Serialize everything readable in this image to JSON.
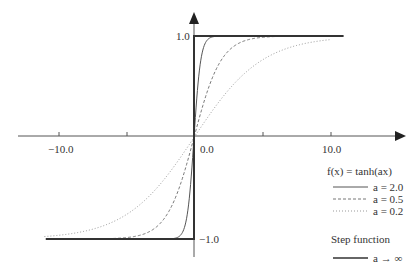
{
  "chart_data": {
    "type": "line",
    "title": "",
    "xlabel": "",
    "ylabel": "",
    "xlim": [
      -13,
      15.5
    ],
    "ylim": [
      -1.15,
      1.2
    ],
    "grid": false,
    "legend_position": "right",
    "x_ticks": [
      -10,
      -5,
      5,
      10
    ],
    "x_tick_labels": [
      {
        "value": -10,
        "label": "−10.0"
      },
      {
        "value": 0,
        "label": "0.0"
      },
      {
        "value": 10,
        "label": "10.0"
      }
    ],
    "y_tick_labels": [
      {
        "value": 1,
        "label": "1.0"
      },
      {
        "value": -1,
        "label": "−1.0"
      }
    ],
    "x_range": [
      -11,
      11
    ],
    "series": [
      {
        "name": "a = 2.0",
        "a": 2.0,
        "function": "tanh(2.0x)",
        "style": "solid",
        "color": "#555555",
        "width": 1
      },
      {
        "name": "a = 0.5",
        "a": 0.5,
        "function": "tanh(0.5x)",
        "style": "dashed",
        "color": "#777777",
        "width": 1
      },
      {
        "name": "a = 0.2",
        "a": 0.2,
        "function": "tanh(0.2x)",
        "style": "dotted",
        "color": "#999999",
        "width": 1
      },
      {
        "name": "a → ∞",
        "a": "infinity",
        "function": "step",
        "style": "solid",
        "color": "#333333",
        "width": 2
      }
    ],
    "sample_points": {
      "x": [
        -10,
        -5,
        -2,
        -1,
        0,
        1,
        2,
        5,
        10
      ],
      "a_2.0": [
        -1.0,
        -1.0,
        -0.999,
        -0.964,
        0.0,
        0.964,
        0.999,
        1.0,
        1.0
      ],
      "a_0.5": [
        -0.999,
        -0.987,
        -0.762,
        -0.462,
        0.0,
        0.462,
        0.762,
        0.987,
        0.999
      ],
      "a_0.2": [
        -0.964,
        -0.762,
        -0.38,
        -0.197,
        0.0,
        0.197,
        0.38,
        0.762,
        0.964
      ],
      "step": [
        -1,
        -1,
        -1,
        -1,
        0,
        1,
        1,
        1,
        1
      ]
    },
    "legend": {
      "title": "f(x) = tanh(ax)",
      "entries": [
        "a = 2.0",
        "a = 0.5",
        "a = 0.2"
      ],
      "step_title": "Step function",
      "step_entry": "a → ∞"
    }
  },
  "axes": {
    "x_tick_labels": [
      "−10.0",
      "0.0",
      "10.0"
    ],
    "y_tick_labels": [
      "1.0",
      "−1.0"
    ]
  },
  "legend": {
    "title": "f(x) = tanh(ax)",
    "items": [
      {
        "label": "a = 2.0"
      },
      {
        "label": "a = 0.5"
      },
      {
        "label": "a = 0.2"
      }
    ],
    "step_title": "Step function",
    "step_item": "a → ∞"
  }
}
